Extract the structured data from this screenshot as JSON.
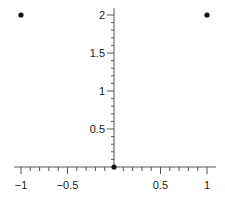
{
  "chart_data": {
    "type": "scatter",
    "title": "",
    "xlabel": "",
    "ylabel": "",
    "xlim": [
      -1.08,
      1.08
    ],
    "ylim": [
      0,
      2.09
    ],
    "grid": false,
    "legend": null,
    "x_ticks": [
      -1,
      -0.5,
      0.5,
      1
    ],
    "x_tick_labels": [
      "−1",
      "−0.5",
      "0.5",
      "1"
    ],
    "y_ticks": [
      0.5,
      1,
      1.5,
      2
    ],
    "y_tick_labels": [
      "0.5",
      "1",
      "1.5",
      "2"
    ],
    "minor_tick_step": 0.1,
    "series": [
      {
        "name": "points",
        "x": [
          -1,
          0,
          1
        ],
        "y": [
          2,
          0,
          2
        ],
        "marker": "circle",
        "color": "#111111"
      }
    ]
  },
  "colors": {
    "axis": "#555555",
    "point": "#111111",
    "text": "#222222"
  }
}
